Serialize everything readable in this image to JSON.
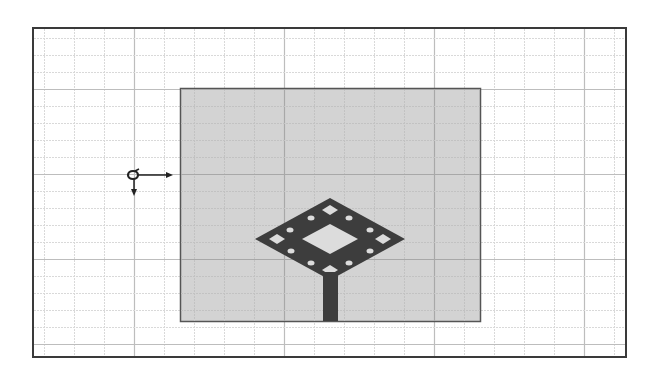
{
  "view": {
    "title": "",
    "description": "Layout view of a diamond-shaped fractal patch antenna with microstrip feed on a substrate, with coordinate origin marker"
  },
  "colors": {
    "background": "#ffffff",
    "frame_border": "#3a3a3a",
    "grid_minor": "#d9d9d9",
    "grid_major": "#bdbdbd",
    "substrate_fill": "#d3d3d3",
    "substrate_border": "#555555",
    "patch_fill": "#3d3d3d",
    "slot_fill": "#dcdcdc",
    "origin_marker": "#222222"
  },
  "grid": {
    "minor_spacing_x": 30,
    "minor_spacing_y": 17,
    "major_every": 5,
    "origin_x": 134,
    "origin_y": 89
  },
  "frame": {
    "x": 32,
    "y": 27,
    "width": 595,
    "height": 331
  },
  "substrate": {
    "x": 180,
    "y": 88,
    "width": 300,
    "height": 233
  },
  "origin_marker": {
    "x": 133,
    "y": 175,
    "x_arrow_end": 173,
    "y_arrow_end": 196
  },
  "patch": {
    "center_x": 330,
    "center_y": 239,
    "half_width": 75,
    "half_height": 41,
    "inner_slot": {
      "half_width": 28,
      "half_height": 15
    },
    "corner_slots": [
      {
        "x": 330,
        "y": 210
      },
      {
        "x": 277,
        "y": 239
      },
      {
        "x": 383,
        "y": 239
      },
      {
        "x": 330,
        "y": 270
      }
    ],
    "corner_slot_half_width": 8,
    "corner_slot_half_height": 5,
    "holes": [
      {
        "x": 311,
        "y": 218
      },
      {
        "x": 349,
        "y": 218
      },
      {
        "x": 290,
        "y": 230
      },
      {
        "x": 370,
        "y": 230
      },
      {
        "x": 291,
        "y": 251
      },
      {
        "x": 370,
        "y": 251
      },
      {
        "x": 311,
        "y": 263
      },
      {
        "x": 349,
        "y": 263
      }
    ],
    "hole_radius": 3
  },
  "feed_line": {
    "x": 323,
    "y": 272,
    "width": 15,
    "height": 49
  }
}
